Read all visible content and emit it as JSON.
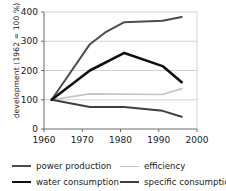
{
  "chart_data": {
    "type": "line",
    "title": "",
    "xlabel": "",
    "ylabel": "development (1962 = 100 %)",
    "xlim": [
      1960,
      2000
    ],
    "ylim": [
      0,
      400
    ],
    "xticks": [
      1960,
      1970,
      1980,
      1990,
      2000
    ],
    "yticks": [
      0,
      100,
      200,
      300,
      400
    ],
    "xtick_labels": [
      "1960",
      "1970",
      "1980",
      "1990",
      "2000"
    ],
    "ytick_labels": [
      "0",
      "100",
      "200",
      "300",
      "400"
    ],
    "grid": "horizontal",
    "legend_position": "bottom",
    "series": [
      {
        "name": "power production",
        "color": "#4d4d4d",
        "width": 2.0,
        "x": [
          1962,
          1972,
          1976,
          1981,
          1991,
          1996
        ],
        "values": [
          100,
          290,
          330,
          365,
          370,
          383
        ]
      },
      {
        "name": "efficiency",
        "color": "#c4c4c4",
        "width": 1.6,
        "x": [
          1962,
          1972,
          1991,
          1996
        ],
        "values": [
          100,
          120,
          118,
          138
        ]
      },
      {
        "name": "water consumption",
        "color": "#101010",
        "width": 2.6,
        "x": [
          1962,
          1972,
          1981,
          1991,
          1996
        ],
        "values": [
          100,
          200,
          260,
          215,
          160
        ]
      },
      {
        "name": "specific consumption",
        "color": "#3f3f3f",
        "width": 2.0,
        "x": [
          1962,
          1972,
          1981,
          1991,
          1996
        ],
        "values": [
          100,
          75,
          75,
          62,
          42
        ]
      }
    ]
  },
  "axis": {
    "y_title": "development (1962 = 100 %)"
  },
  "legend": {
    "entries": [
      {
        "label": "power production",
        "color": "#4d4d4d",
        "width": 2.0
      },
      {
        "label": "efficiency",
        "color": "#c4c4c4",
        "width": 1.6
      },
      {
        "label": "water consumption",
        "color": "#101010",
        "width": 2.6
      },
      {
        "label": "specific consumption",
        "color": "#3f3f3f",
        "width": 2.0
      }
    ]
  }
}
